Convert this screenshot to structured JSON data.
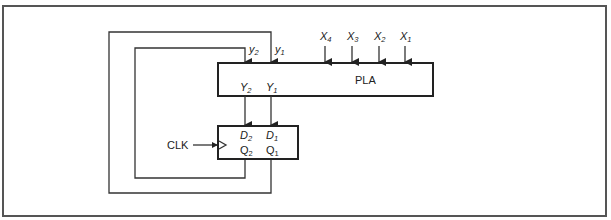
{
  "diagram": {
    "type": "sequential-circuit-block-diagram",
    "colors": {
      "line": "#333333",
      "background": "#ffffff",
      "frame": "#555555"
    },
    "pla": {
      "label": "PLA",
      "inputs": [
        {
          "name": "X",
          "sub": "4"
        },
        {
          "name": "X",
          "sub": "3"
        },
        {
          "name": "X",
          "sub": "2"
        },
        {
          "name": "X",
          "sub": "1"
        }
      ],
      "feedback_inputs": [
        {
          "name": "y",
          "sub": "2"
        },
        {
          "name": "y",
          "sub": "1"
        }
      ],
      "outputs": [
        {
          "name": "Y",
          "sub": "2"
        },
        {
          "name": "Y",
          "sub": "1"
        }
      ]
    },
    "flipflops": {
      "d_inputs": [
        {
          "name": "D",
          "sub": "2"
        },
        {
          "name": "D",
          "sub": "1"
        }
      ],
      "q_outputs": [
        {
          "name": "Q",
          "sub": "2"
        },
        {
          "name": "Q",
          "sub": "1"
        }
      ],
      "clock_label": "CLK"
    }
  }
}
